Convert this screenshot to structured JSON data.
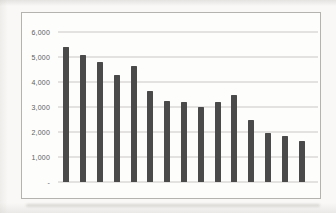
{
  "chart_data": {
    "type": "bar",
    "title": "",
    "xlabel": "",
    "ylabel": "",
    "categories": [
      "",
      "",
      "",
      "",
      "",
      "",
      "",
      "",
      "",
      "",
      "",
      "",
      "",
      "",
      ""
    ],
    "values": [
      5400,
      5100,
      4800,
      4300,
      4650,
      3650,
      3250,
      3200,
      3000,
      3200,
      3500,
      2500,
      1950,
      1850,
      1650
    ],
    "ylim": [
      0,
      6000
    ],
    "y_ticks": [
      {
        "label": "6,000",
        "value": 6000
      },
      {
        "label": "5,000",
        "value": 5000
      },
      {
        "label": "4,000",
        "value": 4000
      },
      {
        "label": "3,000",
        "value": 3000
      },
      {
        "label": "2,000",
        "value": 2000
      },
      {
        "label": "1,000",
        "value": 1000
      },
      {
        "label": "-",
        "value": 0
      }
    ],
    "grid": true,
    "legend": false,
    "colors": {
      "bar": "#4a4a4a",
      "gridline": "#c9c8c4",
      "frame_border": "#b5b3af",
      "tick_label": "#5c5c5c",
      "chart_background": "#fdfdfc"
    }
  }
}
